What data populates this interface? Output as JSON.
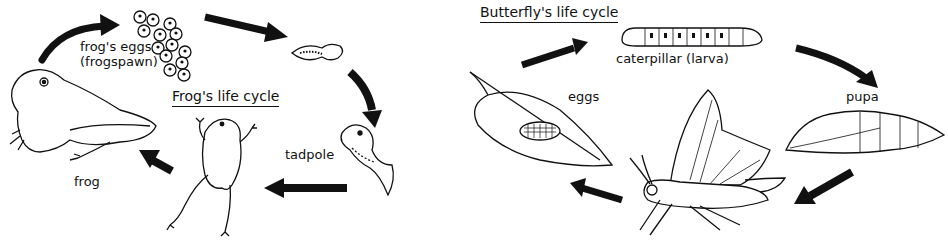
{
  "frog_cycle": {
    "title": "Frog's life cycle",
    "stages": [
      {
        "id": "eggs",
        "label_line1": "frog's eggs",
        "label_line2": "(frogspawn)"
      },
      {
        "id": "embryo",
        "label": ""
      },
      {
        "id": "tadpole",
        "label": "tadpole"
      },
      {
        "id": "froglet",
        "label": ""
      },
      {
        "id": "frog",
        "label": "frog"
      }
    ],
    "sequence": [
      "frog",
      "eggs",
      "embryo",
      "tadpole",
      "froglet",
      "frog"
    ]
  },
  "butterfly_cycle": {
    "title": "Butterfly's life cycle",
    "stages": [
      {
        "id": "eggs",
        "label": "eggs"
      },
      {
        "id": "caterpillar",
        "label": "caterpillar (larva)"
      },
      {
        "id": "pupa",
        "label": "pupa"
      },
      {
        "id": "adult",
        "label": ""
      }
    ],
    "sequence": [
      "eggs",
      "caterpillar",
      "pupa",
      "adult",
      "eggs"
    ]
  },
  "colors": {
    "ink": "#111111",
    "background": "#ffffff"
  }
}
